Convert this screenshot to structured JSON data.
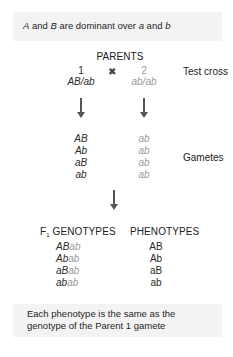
{
  "top_note": {
    "parts": [
      {
        "text": "A",
        "italic": true
      },
      {
        "text": " and ",
        "italic": false
      },
      {
        "text": "B",
        "italic": true
      },
      {
        "text": " are dominant over ",
        "italic": false
      },
      {
        "text": "a",
        "italic": true
      },
      {
        "text": " and ",
        "italic": false
      },
      {
        "text": "b",
        "italic": true
      }
    ]
  },
  "parents": {
    "heading": "PARENTS",
    "cross_symbol": "✖",
    "parent1": {
      "number": "1",
      "genotype": "AB/ab"
    },
    "parent2": {
      "number": "2",
      "genotype": "ab/ab"
    },
    "side_label": "Test cross"
  },
  "gametes": {
    "parent1": [
      "AB",
      "Ab",
      "aB",
      "ab"
    ],
    "parent2": [
      "ab",
      "ab",
      "ab",
      "ab"
    ],
    "side_label": "Gametes"
  },
  "offspring": {
    "genotypes_heading_prefix": "F",
    "genotypes_heading_sub": "1",
    "genotypes_heading_suffix": " GENOTYPES",
    "phenotypes_heading": "PHENOTYPES",
    "genotypes": [
      {
        "p1": "AB",
        "p2": "ab"
      },
      {
        "p1": "Ab",
        "p2": "ab"
      },
      {
        "p1": "aB",
        "p2": "ab"
      },
      {
        "p1": "ab",
        "p2": "ab"
      }
    ],
    "phenotypes": [
      "AB",
      "Ab",
      "aB",
      "ab"
    ]
  },
  "bottom_note": {
    "line1": "Each phenotype is the same as the",
    "line2": "genotype of the Parent 1 gamete"
  },
  "colors": {
    "box_bg": "#f3f3f3",
    "parent2_gray": "#9a9a9a",
    "arrow": "#555555"
  }
}
